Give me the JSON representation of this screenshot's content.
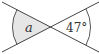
{
  "diagram": {
    "type": "intersecting-lines-vertical-angles",
    "colors": {
      "line": "#444444",
      "shade": "#e6e6e6",
      "text": "#333333",
      "background": "#ffffff"
    },
    "angles": [
      {
        "position": "left",
        "label": "a",
        "shaded": true
      },
      {
        "position": "right",
        "label": "47°",
        "shaded": false
      }
    ]
  }
}
